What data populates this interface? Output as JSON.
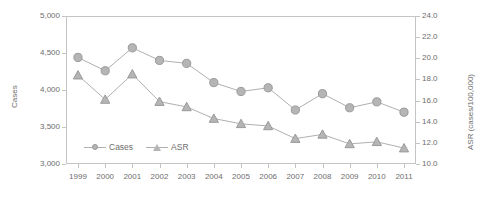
{
  "chart_data": {
    "type": "line",
    "title": "",
    "subtitle": "",
    "xlabel": "",
    "ylabel": "Cases",
    "y2label": "ASR (cases/100,000)",
    "categories": [
      "1999",
      "2000",
      "2001",
      "2002",
      "2003",
      "2004",
      "2005",
      "2006",
      "2007",
      "2008",
      "2009",
      "2010",
      "2011"
    ],
    "x": [
      1999,
      2000,
      2001,
      2002,
      2003,
      2004,
      2005,
      2006,
      2007,
      2008,
      2009,
      2010,
      2011
    ],
    "ylim": [
      3000,
      5000
    ],
    "y2lim": [
      10.0,
      24.0
    ],
    "yticks": [
      "3,000",
      "3,500",
      "4,000",
      "4,500",
      "5,000"
    ],
    "ytick_values": [
      3000,
      3500,
      4000,
      4500,
      5000
    ],
    "y2ticks": [
      "10.0",
      "12.0",
      "14.0",
      "16.0",
      "18.0",
      "20.0",
      "22.0",
      "24.0"
    ],
    "y2tick_values": [
      10.0,
      12.0,
      14.0,
      16.0,
      18.0,
      20.0,
      22.0,
      24.0
    ],
    "grid": false,
    "legend_position": "inside-bottom-left",
    "series": [
      {
        "name": "Cases",
        "axis": "left",
        "marker": "circle",
        "color": "#b5b5b5",
        "line_color": "#b0b0b0",
        "values": [
          4440,
          4260,
          4570,
          4400,
          4360,
          4100,
          3980,
          4030,
          3730,
          3950,
          3760,
          3840,
          3700
        ]
      },
      {
        "name": "ASR",
        "axis": "right",
        "marker": "triangle",
        "color": "#b5b5b5",
        "line_color": "#b0b0b0",
        "values": [
          18.4,
          16.1,
          18.5,
          15.9,
          15.4,
          14.3,
          13.8,
          13.6,
          12.4,
          12.8,
          11.9,
          12.1,
          11.5
        ]
      }
    ]
  },
  "legend": {
    "items": [
      {
        "label": "Cases",
        "marker": "circle"
      },
      {
        "label": "ASR",
        "marker": "triangle"
      }
    ]
  }
}
